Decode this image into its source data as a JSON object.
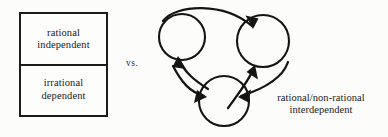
{
  "figure": {
    "background_color": "#fcfcfb",
    "ink_color": "#141414"
  },
  "left_model": {
    "name": "hierarchical-box",
    "cells": [
      {
        "id": "top",
        "text": "rational\nindependent"
      },
      {
        "id": "bottom",
        "text": "irrational\ndependent"
      }
    ]
  },
  "separator": {
    "label": "vs."
  },
  "right_model": {
    "caption": "rational/non-rational\ninterdependent",
    "nodes": [
      {
        "id": "left-circle",
        "cx": 32,
        "cy": 37,
        "r": 23
      },
      {
        "id": "right-circle",
        "cx": 113,
        "cy": 41,
        "r": 26
      },
      {
        "id": "bottom-circle",
        "cx": 74,
        "cy": 101,
        "r": 25
      }
    ],
    "arrows": [
      {
        "id": "left-to-right",
        "from": "left-circle",
        "to": "right-circle"
      },
      {
        "id": "right-to-bottom",
        "from": "right-circle",
        "to": "bottom-circle"
      },
      {
        "id": "bottom-to-left",
        "from": "bottom-circle",
        "to": "left-circle"
      },
      {
        "id": "bottom-to-right",
        "from": "bottom-circle",
        "to": "right-circle"
      },
      {
        "id": "left-to-bottom",
        "from": "left-circle",
        "to": "bottom-circle"
      }
    ]
  }
}
